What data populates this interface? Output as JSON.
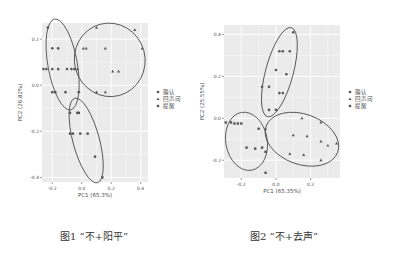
{
  "chart_data": [
    {
      "type": "scatter",
      "title": "",
      "xlabel": "PC1 (65.3%)",
      "ylabel": "PC2 (26.82%)",
      "xlim": [
        -0.27,
        0.45
      ],
      "ylim": [
        -0.42,
        0.27
      ],
      "xticks": [
        -0.2,
        0.0,
        0.2,
        0.4
      ],
      "xtick_labels": [
        "-0.2",
        "0.0",
        "0.2",
        "0.4"
      ],
      "yticks": [
        0.2,
        0.0,
        -0.2,
        -0.4
      ],
      "ytick_labels": [
        "0.2",
        "0.0",
        "-0.2",
        "-0.4"
      ],
      "grid": true,
      "legend_position": "right",
      "series": [
        {
          "name": "确认",
          "marker": "circle",
          "points": [
            [
              -0.23,
              0.25
            ],
            [
              -0.2,
              0.16
            ],
            [
              -0.16,
              0.16
            ],
            [
              -0.26,
              0.07
            ],
            [
              -0.24,
              0.07
            ],
            [
              -0.2,
              0.07
            ],
            [
              -0.16,
              0.07
            ],
            [
              -0.1,
              0.07
            ],
            [
              -0.07,
              0.07
            ],
            [
              -0.05,
              0.07
            ],
            [
              -0.2,
              -0.03
            ],
            [
              -0.18,
              -0.03
            ],
            [
              -0.11,
              -0.03
            ],
            [
              -0.02,
              -0.03
            ]
          ]
        },
        {
          "name": "回声问",
          "marker": "triangle",
          "points": [
            [
              0.1,
              0.25
            ],
            [
              0.36,
              0.24
            ],
            [
              0.01,
              0.16
            ],
            [
              0.03,
              0.16
            ],
            [
              0.16,
              0.16
            ],
            [
              0.41,
              0.16
            ],
            [
              0.21,
              0.06
            ],
            [
              0.25,
              0.06
            ],
            [
              0.1,
              -0.03
            ],
            [
              0.16,
              -0.03
            ],
            [
              -0.03,
              0.07
            ]
          ]
        },
        {
          "name": "提醒",
          "marker": "square",
          "points": [
            [
              -0.08,
              -0.12
            ],
            [
              -0.03,
              -0.12
            ],
            [
              -0.02,
              -0.12
            ],
            [
              -0.08,
              -0.21
            ],
            [
              -0.06,
              -0.21
            ],
            [
              -0.01,
              -0.21
            ],
            [
              0.04,
              -0.21
            ],
            [
              0.09,
              -0.31
            ],
            [
              0.14,
              -0.4
            ]
          ]
        }
      ],
      "ellipses": [
        {
          "group": "确认",
          "cx": -0.13,
          "cy": 0.09,
          "rx": 0.1,
          "ry": 0.2,
          "angle": -10
        },
        {
          "group": "回声问",
          "cx": 0.19,
          "cy": 0.11,
          "rx": 0.24,
          "ry": 0.16,
          "angle": -15
        },
        {
          "group": "提醒",
          "cx": 0.03,
          "cy": -0.24,
          "rx": 0.09,
          "ry": 0.19,
          "angle": -15
        }
      ]
    },
    {
      "type": "scatter",
      "title": "",
      "xlabel": "PC1 (65.35%)",
      "ylabel": "PC2 (25.55%)",
      "xlim": [
        -0.3,
        0.37
      ],
      "ylim": [
        -0.285,
        0.445
      ],
      "xticks": [
        -0.2,
        0.0,
        0.2
      ],
      "xtick_labels": [
        "-0.2",
        "0.0",
        "0.2"
      ],
      "yticks": [
        0.4,
        0.2,
        0.0,
        -0.2
      ],
      "ytick_labels": [
        "0.4",
        "0.2",
        "0.0",
        "-0.2"
      ],
      "grid": true,
      "legend_position": "right",
      "series": [
        {
          "name": "确认",
          "marker": "circle",
          "points": [
            [
              0.1,
              0.41
            ],
            [
              0.02,
              0.32
            ],
            [
              0.04,
              0.32
            ],
            [
              0.08,
              0.32
            ],
            [
              0.0,
              0.23
            ],
            [
              0.06,
              0.21
            ],
            [
              -0.08,
              0.15
            ],
            [
              -0.04,
              0.15
            ],
            [
              0.02,
              0.12
            ],
            [
              0.04,
              0.12
            ],
            [
              -0.04,
              0.04
            ],
            [
              0.0,
              0.04
            ]
          ]
        },
        {
          "name": "回声问",
          "marker": "triangle",
          "points": [
            [
              0.15,
              0.0
            ],
            [
              0.26,
              -0.02
            ],
            [
              0.1,
              -0.08
            ],
            [
              0.18,
              -0.085
            ],
            [
              0.26,
              -0.11
            ],
            [
              0.3,
              -0.13
            ],
            [
              0.35,
              -0.12
            ],
            [
              0.08,
              -0.17
            ],
            [
              0.16,
              -0.175
            ],
            [
              0.26,
              -0.2
            ],
            [
              -0.06,
              -0.05
            ]
          ]
        },
        {
          "name": "提醒",
          "marker": "square",
          "points": [
            [
              -0.29,
              -0.02
            ],
            [
              -0.26,
              -0.02
            ],
            [
              -0.24,
              -0.025
            ],
            [
              -0.22,
              -0.025
            ],
            [
              -0.2,
              -0.025
            ],
            [
              -0.1,
              -0.05
            ],
            [
              -0.17,
              -0.14
            ],
            [
              -0.12,
              -0.145
            ],
            [
              -0.08,
              -0.14
            ],
            [
              -0.06,
              -0.16
            ],
            [
              -0.06,
              -0.26
            ]
          ]
        }
      ],
      "ellipses": [
        {
          "group": "确认",
          "cx": 0.02,
          "cy": 0.22,
          "rx": 0.08,
          "ry": 0.22,
          "angle": 15
        },
        {
          "group": "回声问",
          "cx": 0.15,
          "cy": -0.1,
          "rx": 0.22,
          "ry": 0.12,
          "angle": 20
        },
        {
          "group": "提醒",
          "cx": -0.17,
          "cy": -0.11,
          "rx": 0.12,
          "ry": 0.14,
          "angle": -10
        }
      ]
    }
  ],
  "captions": {
    "fig1": "图1 “不+阳平”",
    "fig2": "图2 “不+去声”"
  },
  "layout": [
    {
      "panel": [
        42,
        23,
        148,
        182
      ]
    },
    {
      "panel": [
        24,
        25,
        140,
        178
      ]
    }
  ],
  "colors": {
    "panel_bg": "#ebebeb",
    "grid": "#ffffff",
    "point": "#555555",
    "ellipse": "#444444",
    "text": "#4d4d4d"
  }
}
